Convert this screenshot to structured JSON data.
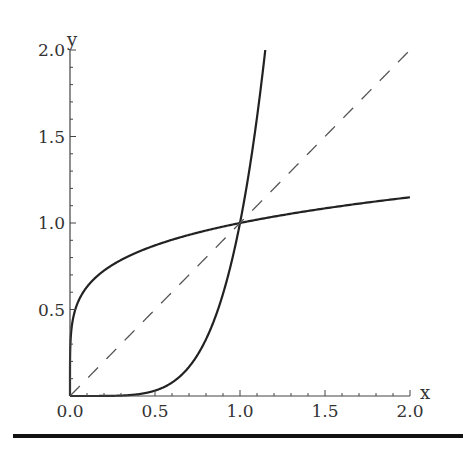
{
  "chart_data": {
    "type": "line",
    "title": "",
    "xlabel": "x",
    "ylabel": "y",
    "xlim": [
      0,
      2.0
    ],
    "ylim": [
      0,
      2.0
    ],
    "grid": false,
    "legend": null,
    "x_ticks": [
      "0.0",
      "0.5",
      "1.0",
      "1.5",
      "2.0"
    ],
    "y_ticks": [
      "0.5",
      "1.0",
      "1.5",
      "2.0"
    ],
    "series": [
      {
        "name": "y = x^(1/5)",
        "style": "solid",
        "color": "#222222",
        "x": [
          0,
          0.01,
          0.05,
          0.1,
          0.25,
          0.5,
          0.75,
          1.0,
          1.25,
          1.5,
          1.75,
          2.0
        ],
        "y": [
          0,
          0.4,
          0.55,
          0.63,
          0.76,
          0.87,
          0.94,
          1.0,
          1.05,
          1.08,
          1.12,
          1.15
        ]
      },
      {
        "name": "y = x^5",
        "style": "solid",
        "color": "#222222",
        "x": [
          0,
          0.25,
          0.5,
          0.75,
          0.9,
          1.0,
          1.05,
          1.1,
          1.149
        ],
        "y": [
          0,
          0.001,
          0.031,
          0.237,
          0.59,
          1.0,
          1.28,
          1.61,
          2.0
        ]
      },
      {
        "name": "y = x",
        "style": "dashed",
        "color": "#555555",
        "x": [
          0,
          2.0
        ],
        "y": [
          0,
          2.0
        ]
      }
    ],
    "annotations": []
  }
}
